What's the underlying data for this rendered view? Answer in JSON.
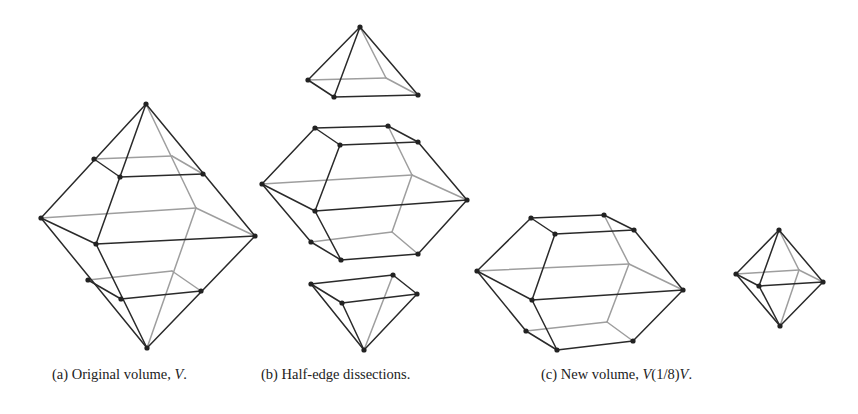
{
  "figure": {
    "subfigures": [
      {
        "id": "a",
        "caption_prefix": "(a) Original volume, ",
        "caption_var": "V",
        "caption_suffix": ".",
        "shapes": [
          "octahedron-with-half-edge-cuts"
        ]
      },
      {
        "id": "b",
        "caption_prefix": "(b) Half-edge dissections.",
        "caption_var": "",
        "caption_suffix": "",
        "shapes": [
          "top-pyramid",
          "truncated-middle-solid",
          "bottom-pyramid"
        ]
      },
      {
        "id": "c",
        "caption_prefix": "(c) New volume, ",
        "caption_var": "V",
        "caption_suffix": "(1/8)V.",
        "shapes": [
          "truncated-solid",
          "small-octahedron"
        ]
      }
    ]
  }
}
